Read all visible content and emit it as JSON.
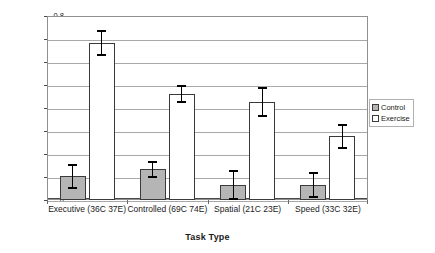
{
  "chart_data": {
    "type": "bar",
    "title": "",
    "xlabel": "Task Type",
    "ylabel": "Effect size (g)",
    "ylim": [
      0,
      0.8
    ],
    "ytick_step": 0.1,
    "yticks": [
      "0.8",
      "0.7",
      "0.6",
      "0.5",
      "0.4",
      "0.3",
      "0.2",
      "0.1",
      "0"
    ],
    "grid": true,
    "legend_position": "right",
    "categories": [
      "Executive (36C 37E)",
      "Controlled (69C 74E)",
      "Spatial (21C 23E)",
      "Speed (33C 32E)"
    ],
    "series": [
      {
        "name": "Control",
        "color": "#b5b5b5",
        "values": [
          0.105,
          0.133,
          0.065,
          0.064
        ],
        "err_low": [
          0.052,
          0.098,
          0.003,
          0.012
        ],
        "err_high": [
          0.153,
          0.167,
          0.127,
          0.116
        ]
      },
      {
        "name": "Exercise",
        "color": "#ffffff",
        "values": [
          0.684,
          0.46,
          0.425,
          0.277
        ],
        "err_low": [
          0.632,
          0.425,
          0.364,
          0.224
        ],
        "err_high": [
          0.735,
          0.494,
          0.488,
          0.325
        ]
      }
    ]
  },
  "legend": {
    "items": [
      {
        "label": "Control"
      },
      {
        "label": "Exercise"
      }
    ]
  }
}
